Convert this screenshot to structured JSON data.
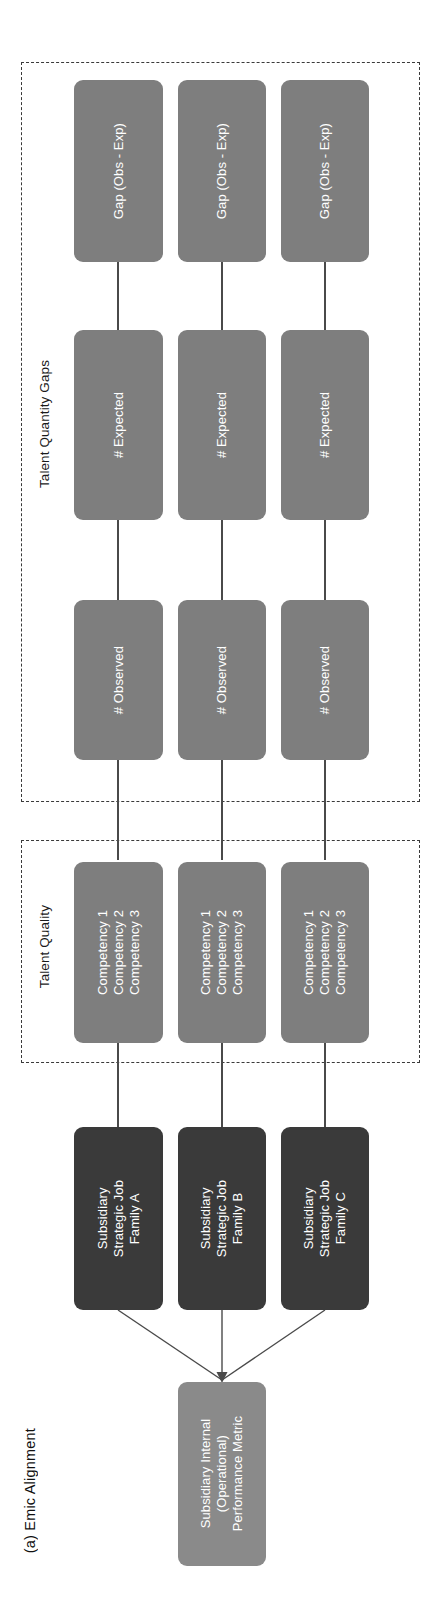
{
  "figure": {
    "caption": "(a) Emic Alignment",
    "orientation": "rotated-90-counterclockwise",
    "colors": {
      "background": "#ffffff",
      "gray_node": "#7e7e7e",
      "dark_node": "#3a3a3a",
      "metric_node": "#8a8a8a",
      "connector": "#4a4a4a",
      "dashed_border": "#3a3a3a",
      "node_text": "#ffffff",
      "label_text": "#1a1a1a"
    }
  },
  "groups": [
    {
      "id": "talent-quantity-gaps",
      "label": "Talent Quantity Gaps"
    },
    {
      "id": "talent-quality",
      "label": "Talent Quality"
    }
  ],
  "gap_nodes": {
    "row_labels": [
      "Gap (Obs - Exp)",
      "# Expected",
      "# Observed"
    ],
    "rows": [
      {
        "label": "Gap (Obs - Exp)",
        "columns": [
          "Gap (Obs - Exp)",
          "Gap (Obs - Exp)",
          "Gap (Obs - Exp)"
        ]
      },
      {
        "label": "# Expected",
        "columns": [
          "# Expected",
          "# Expected",
          "# Expected"
        ]
      },
      {
        "label": "# Observed",
        "columns": [
          "# Observed",
          "# Observed",
          "# Observed"
        ]
      }
    ]
  },
  "competency_nodes": {
    "lines": [
      "Competency 1",
      "Competency 2",
      "Competency 3"
    ],
    "columns": [
      "Competency 1\nCompetency 2\nCompetency 3",
      "Competency 1\nCompetency 2\nCompetency 3",
      "Competency 1\nCompetency 2\nCompetency 3"
    ]
  },
  "job_family_nodes": {
    "columns": [
      "Subsidiary\nStrategic Job\nFamily A",
      "Subsidiary\nStrategic Job\nFamily B",
      "Subsidiary\nStrategic Job\nFamily C"
    ]
  },
  "metric_node": {
    "label": "Subsidiary Internal\n(Operational)\nPerformance Metric"
  }
}
